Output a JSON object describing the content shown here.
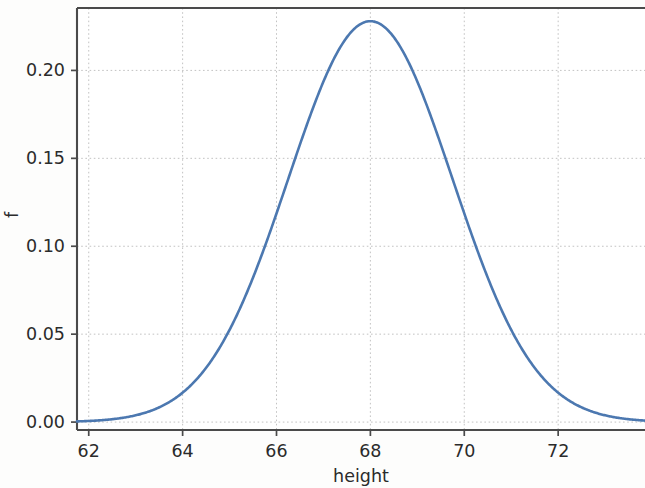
{
  "chart_data": {
    "type": "line",
    "title": "",
    "subtitle": "",
    "xlabel": "height",
    "ylabel": "f",
    "xlim": [
      61.75,
      73.85
    ],
    "ylim": [
      -0.0045,
      0.2355
    ],
    "grid": true,
    "legend": null,
    "legend_position": "none",
    "xticks": [
      62,
      64,
      66,
      68,
      70,
      72
    ],
    "xtick_labels": [
      "62",
      "64",
      "66",
      "68",
      "70",
      "72"
    ],
    "yticks": [
      0.0,
      0.05,
      0.1,
      0.15,
      0.2
    ],
    "ytick_labels": [
      "0.00",
      "0.05",
      "0.10",
      "0.15",
      "0.20"
    ],
    "annotations": [],
    "series": [
      {
        "name": "normal pdf",
        "color": "#4c78b0",
        "distribution": "normal",
        "mean": 68.0,
        "sigma": 1.75,
        "peak_value": 0.228,
        "x": [
          61.75,
          62.0,
          62.5,
          63.0,
          63.5,
          64.0,
          64.5,
          65.0,
          65.5,
          66.0,
          66.5,
          67.0,
          67.5,
          68.0,
          68.5,
          69.0,
          69.5,
          70.0,
          70.5,
          71.0,
          71.5,
          72.0,
          72.5,
          73.0,
          73.5,
          73.85
        ],
        "values": [
          0.001,
          0.0013,
          0.0026,
          0.0048,
          0.0085,
          0.0143,
          0.0231,
          0.0354,
          0.0519,
          0.0726,
          0.097,
          0.1238,
          0.151,
          0.1761,
          0.1964,
          0.2095,
          0.2136,
          0.2095,
          0.1964,
          0.1761,
          0.151,
          0.1238,
          0.097,
          0.0726,
          0.0519,
          0.041
        ]
      }
    ]
  },
  "axes": {
    "x_title": "height",
    "y_title": "f"
  }
}
